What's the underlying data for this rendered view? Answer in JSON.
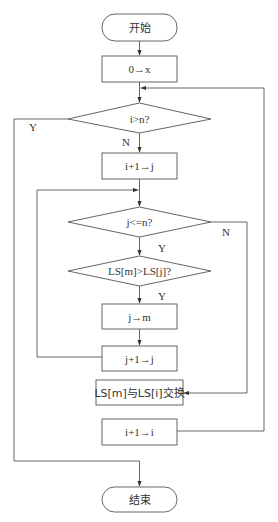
{
  "flowchart": {
    "nodes": {
      "start": {
        "label": "开始",
        "type": "terminator"
      },
      "init_x": {
        "label": "0→x",
        "type": "process"
      },
      "cond_i_gt_n": {
        "label": "i>n?",
        "type": "decision"
      },
      "assign_j": {
        "label": "i+1→j",
        "type": "process"
      },
      "cond_j_le_n": {
        "label": "j<=n?",
        "type": "decision"
      },
      "cond_compare": {
        "label": "LS[m]>LS[j]?",
        "type": "decision"
      },
      "assign_m": {
        "label": "j→m",
        "type": "process"
      },
      "inc_j": {
        "label": "j+1→j",
        "type": "process"
      },
      "swap": {
        "label": "LS[m]与LS[i]交换",
        "type": "process"
      },
      "inc_i": {
        "label": "i+1→i",
        "type": "process"
      },
      "end": {
        "label": "结束",
        "type": "terminator"
      }
    },
    "branch_labels": {
      "i_gt_n_yes": "Y",
      "i_gt_n_no": "N",
      "j_le_n_yes": "Y",
      "j_le_n_no": "N",
      "compare_yes": "Y"
    },
    "colors": {
      "stroke": "#555555",
      "text": "#333333",
      "background": "#ffffff"
    }
  }
}
